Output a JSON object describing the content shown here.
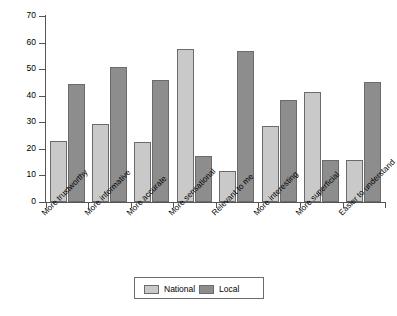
{
  "chart_data": {
    "type": "bar",
    "title": "",
    "xlabel": "",
    "ylabel": "Percentage of respondents",
    "ylim": [
      0,
      70
    ],
    "ytick_labels": [
      "0",
      "10",
      "20",
      "30",
      "40",
      "50",
      "60",
      "70"
    ],
    "ytick_values": [
      0,
      10,
      20,
      30,
      40,
      50,
      60,
      70
    ],
    "grid": false,
    "legend_position": "bottom-center",
    "categories": [
      "More trustworthy",
      "More informative",
      "More accurate",
      "More sensational",
      "Relevant to me",
      "More interesting",
      "More superficial",
      "Easier to understand"
    ],
    "series": [
      {
        "name": "National",
        "color": "#c9c9c9",
        "values": [
          23,
          29.5,
          22.5,
          57.5,
          11.5,
          28.5,
          41.5,
          16
        ]
      },
      {
        "name": "Local",
        "color": "#8d8d8d",
        "values": [
          44.5,
          51,
          46,
          17.5,
          57,
          38.5,
          16,
          45
        ]
      }
    ]
  },
  "legend": {
    "items": [
      {
        "label": "National",
        "swatch": "national"
      },
      {
        "label": "Local",
        "swatch": "local"
      }
    ]
  }
}
